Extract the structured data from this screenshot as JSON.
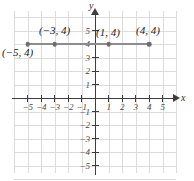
{
  "chart_data": {
    "type": "scatter",
    "title": "",
    "xlabel": "x",
    "ylabel": "y",
    "xlim": [
      -6,
      6
    ],
    "ylim": [
      -6,
      6
    ],
    "grid": true,
    "legend": "none",
    "x_ticks": [
      "-5",
      "-4",
      "-3",
      "-2",
      "-1",
      "1",
      "2",
      "3",
      "4",
      "5"
    ],
    "y_ticks": [
      "5",
      "4",
      "3",
      "2",
      "1",
      "-1",
      "-2",
      "-3",
      "-4",
      "-5"
    ],
    "x_tick_values": [
      -5,
      -4,
      -3,
      -2,
      -1,
      1,
      2,
      3,
      4,
      5
    ],
    "y_tick_values": [
      5,
      4,
      3,
      2,
      1,
      -1,
      -2,
      -3,
      -4,
      -5
    ],
    "points": [
      {
        "x": -5,
        "y": 4,
        "label": "(−5, 4)",
        "label_position": "below-left"
      },
      {
        "x": -3,
        "y": 4,
        "label": "(−3, 4)",
        "label_position": "above"
      },
      {
        "x": 1,
        "y": 4,
        "label": "(1, 4)",
        "label_position": "above-right"
      },
      {
        "x": 4,
        "y": 4,
        "label": "(4, 4)",
        "label_position": "above"
      }
    ],
    "segment": {
      "from": {
        "x": -5,
        "y": 4
      },
      "to": {
        "x": 4,
        "y": 4
      },
      "description": "horizontal segment at y = 4"
    },
    "colors": {
      "grid": "#dddbdb",
      "axis": "#3d3d3d",
      "segment": "#8c8c8c",
      "point": "#6e6e6e",
      "label_text": "#1c1c1c",
      "background": "#ffffff"
    }
  },
  "axes": {
    "x_name": "x",
    "y_name": "y"
  },
  "tick_labels": {
    "x": [
      "−5",
      "−4",
      "−3",
      "−2",
      "−1",
      "1",
      "2",
      "3",
      "4",
      "5"
    ],
    "y": [
      "5",
      "4",
      "3",
      "2",
      "1",
      "−1",
      "−2",
      "−3",
      "−4",
      "−5"
    ]
  },
  "point_labels": {
    "p_n5_4": "(−5, 4)",
    "p_n3_4": "(−3, 4)",
    "p_1_4": "(1, 4)",
    "p_4_4": "(4, 4)"
  }
}
